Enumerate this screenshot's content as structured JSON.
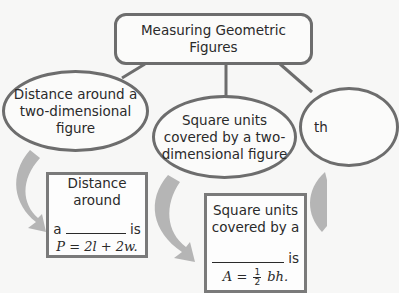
{
  "title": "Measuring Geometric Figures",
  "nodes": {
    "left_ellipse": "Distance around a two-dimensional figure",
    "middle_ellipse": "Square units covered by a two-dimensional figure",
    "right_ellipse_partial": "th"
  },
  "boxes": {
    "left": {
      "line1": "Distance around",
      "prefix": "a",
      "suffix": "is",
      "formula": "P = 2l + 2w."
    },
    "right": {
      "line1": "Square units",
      "line2": "covered by a",
      "suffix": "is",
      "formula_lhs": "A =",
      "frac_num": "1",
      "frac_den": "2",
      "formula_rhs": "bh."
    }
  },
  "colors": {
    "stroke": "#6d6d6d",
    "arrow": "#b5b5b5",
    "background": "#f7f7f6"
  }
}
